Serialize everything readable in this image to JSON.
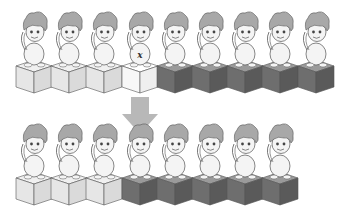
{
  "diagram": {
    "colors": {
      "light_cube_top": "#f0f0f0",
      "light_cube_left": "#e6e6e6",
      "light_cube_right": "#dadada",
      "white_cube_top": "#ffffff",
      "white_cube_left": "#f7f7f7",
      "white_cube_right": "#efefef",
      "dark_cube_top": "#9a9a9a",
      "dark_cube_left": "#6e6e6e",
      "dark_cube_right": "#5a5a5a",
      "hair": "#a8a8a8",
      "skin": "#f4f4f4",
      "outline": "#555555",
      "arrow": "#b8b8b8"
    },
    "top_row": {
      "units": [
        {
          "cube": "light",
          "marker": ""
        },
        {
          "cube": "light",
          "marker": ""
        },
        {
          "cube": "light",
          "marker": ""
        },
        {
          "cube": "white",
          "marker": "x"
        },
        {
          "cube": "dark",
          "marker": ""
        },
        {
          "cube": "dark",
          "marker": ""
        },
        {
          "cube": "dark",
          "marker": ""
        },
        {
          "cube": "dark",
          "marker": ""
        },
        {
          "cube": "dark",
          "marker": ""
        }
      ]
    },
    "arrow": {
      "direction": "down"
    },
    "bottom_row": {
      "units": [
        {
          "cube": "light",
          "marker": ""
        },
        {
          "cube": "light",
          "marker": ""
        },
        {
          "cube": "light",
          "marker": ""
        },
        {
          "cube": "dark",
          "marker": ""
        },
        {
          "cube": "dark",
          "marker": ""
        },
        {
          "cube": "dark",
          "marker": ""
        },
        {
          "cube": "dark",
          "marker": ""
        },
        {
          "cube": "dark",
          "marker": ""
        }
      ]
    },
    "caption": ""
  }
}
